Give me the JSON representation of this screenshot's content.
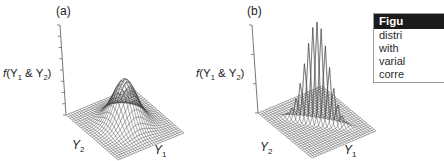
{
  "figure": {
    "panels": [
      {
        "id": "a",
        "label": "(a)",
        "z_axis_label": {
          "func": "f",
          "text": "(Y",
          "sub1": "1",
          "mid": " & Y",
          "sub2": "2",
          "end": ")"
        },
        "y2_label": {
          "var": "Y",
          "sub": "2"
        },
        "y1_label": {
          "var": "Y",
          "sub": "1"
        },
        "description": "Bivariate normal surface with broad rounded peak (uncorrelated variables)"
      },
      {
        "id": "b",
        "label": "(b)",
        "z_axis_label": {
          "func": "f",
          "text": "(Y",
          "sub1": "1",
          "mid": " & Y",
          "sub2": "2",
          "end": ")"
        },
        "y2_label": {
          "var": "Y",
          "sub": "2"
        },
        "y1_label": {
          "var": "Y",
          "sub": "1"
        },
        "description": "Bivariate normal surface with narrow ridge-like peak (highly correlated variables)"
      }
    ],
    "caption": {
      "header": "Figu",
      "lines": [
        "distri",
        "with",
        "varial",
        "corre"
      ]
    }
  },
  "colors": {
    "mesh": "#3a3a3a",
    "axis": "#555555",
    "caption_header_bg": "#1b1b1b"
  }
}
